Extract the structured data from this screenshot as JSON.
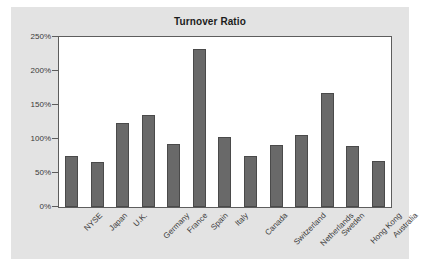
{
  "chart_data": {
    "type": "bar",
    "title": "Turnover Ratio",
    "xlabel": "",
    "ylabel": "",
    "categories": [
      "NYSE",
      "Japan",
      "U.K.",
      "Germany",
      "France",
      "Spain",
      "Italy",
      "Canada",
      "Switzerland",
      "Netherlands",
      "Sweden",
      "Hong Kong",
      "Australia"
    ],
    "values": [
      75,
      66,
      124,
      135,
      92,
      232,
      103,
      75,
      91,
      106,
      168,
      89,
      67
    ],
    "value_unit": "%",
    "ylim": [
      0,
      250
    ],
    "yticks": [
      0,
      50,
      100,
      150,
      200,
      250
    ],
    "ytick_labels": [
      "0%",
      "50%",
      "100%",
      "150%",
      "200%",
      "250%"
    ],
    "grid": false,
    "legend": null,
    "series_color": "#696969",
    "plot_background": "#ffffff",
    "figure_background": "#e3e3e3",
    "axis_color": "#5d5d5d",
    "text_color": "#3a3a3a",
    "xtick_rotation": -45
  }
}
